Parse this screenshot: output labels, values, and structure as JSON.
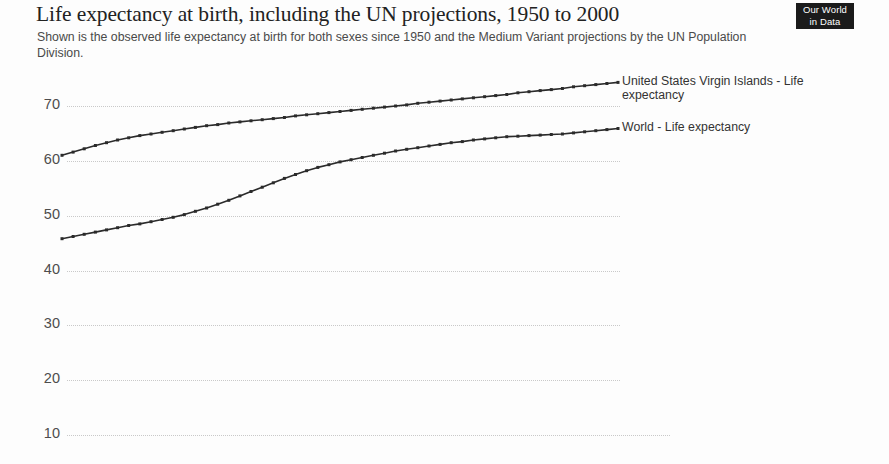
{
  "header": {
    "title": "Life expectancy at birth, including the UN projections, 1950 to 2000",
    "subtitle": "Shown is the observed life expectancy at birth for both sexes since 1950 and the Medium Variant projections by the UN Population Division."
  },
  "logo": {
    "line1": "Our World",
    "line2": "in Data"
  },
  "colors": {
    "line": "#2b2b2b",
    "grid": "#c9c9c9",
    "tick_text": "#4d4d4d",
    "title_text": "#222222",
    "subtitle_text": "#4a4a4a",
    "logo_bg": "#1b1b1b",
    "logo_text": "#ffffff",
    "background": "#fdfdfd"
  },
  "chart_data": {
    "type": "line",
    "title": "Life expectancy at birth, including the UN projections, 1950 to 2000",
    "subtitle": "Shown is the observed life expectancy at birth for both sexes since 1950 and the Medium Variant projections by the UN Population Division.",
    "xlabel": "",
    "ylabel": "",
    "xlim": [
      1950,
      2000
    ],
    "ylim": [
      5,
      76
    ],
    "yticks": [
      10,
      20,
      30,
      40,
      50,
      60,
      70
    ],
    "ytick_labels": [
      "10",
      "20",
      "30",
      "40",
      "50",
      "60",
      "70"
    ],
    "grid": true,
    "grid_style": "dotted-horizontal",
    "legend": "end-of-line-labels",
    "markers": true,
    "x": [
      1950,
      1951,
      1952,
      1953,
      1954,
      1955,
      1956,
      1957,
      1958,
      1959,
      1960,
      1961,
      1962,
      1963,
      1964,
      1965,
      1966,
      1967,
      1968,
      1969,
      1970,
      1971,
      1972,
      1973,
      1974,
      1975,
      1976,
      1977,
      1978,
      1979,
      1980,
      1981,
      1982,
      1983,
      1984,
      1985,
      1986,
      1987,
      1988,
      1989,
      1990,
      1991,
      1992,
      1993,
      1994,
      1995,
      1996,
      1997,
      1998,
      1999,
      2000
    ],
    "series": [
      {
        "name": "United States Virgin Islands - Life expectancy",
        "label_lines": [
          "United States Virgin Islands - Life",
          "expectancy"
        ],
        "color": "#2b2b2b",
        "values": [
          61.0,
          61.6,
          62.2,
          62.8,
          63.3,
          63.8,
          64.2,
          64.6,
          64.9,
          65.2,
          65.5,
          65.8,
          66.1,
          66.4,
          66.6,
          66.9,
          67.1,
          67.3,
          67.5,
          67.7,
          67.9,
          68.2,
          68.4,
          68.6,
          68.8,
          69.0,
          69.2,
          69.4,
          69.6,
          69.8,
          70.0,
          70.2,
          70.5,
          70.7,
          70.9,
          71.1,
          71.3,
          71.5,
          71.7,
          71.9,
          72.1,
          72.4,
          72.6,
          72.8,
          73.0,
          73.2,
          73.5,
          73.7,
          73.9,
          74.1,
          74.3
        ]
      },
      {
        "name": "World - Life expectancy",
        "label_lines": [
          "World - Life expectancy"
        ],
        "color": "#2b2b2b",
        "values": [
          45.8,
          46.2,
          46.6,
          47.0,
          47.4,
          47.8,
          48.2,
          48.5,
          48.9,
          49.3,
          49.7,
          50.2,
          50.8,
          51.4,
          52.1,
          52.8,
          53.6,
          54.4,
          55.2,
          56.0,
          56.8,
          57.5,
          58.2,
          58.8,
          59.3,
          59.8,
          60.2,
          60.6,
          61.0,
          61.4,
          61.8,
          62.1,
          62.4,
          62.7,
          63.0,
          63.3,
          63.5,
          63.8,
          64.0,
          64.2,
          64.4,
          64.5,
          64.6,
          64.7,
          64.8,
          64.9,
          65.1,
          65.3,
          65.5,
          65.7,
          65.9
        ]
      }
    ]
  }
}
